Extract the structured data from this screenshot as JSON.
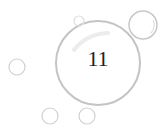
{
  "badge": {
    "number": "11"
  },
  "colors": {
    "bubble_stroke": "#cfcfcf",
    "text": "#222222",
    "background": "#ffffff"
  }
}
